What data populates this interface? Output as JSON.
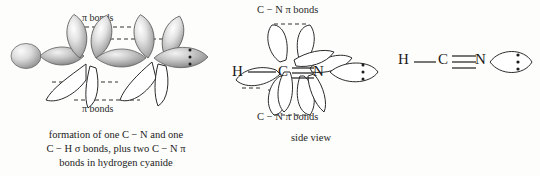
{
  "figure": {
    "background_color": "#fdfdfb",
    "ink_color": "#1c1c1c"
  },
  "panel_orbital": {
    "label_top": "π bonds",
    "label_bottom": "π bonds",
    "caption_lines": [
      "formation of one C − N and one",
      "C − H σ bonds, plus two C − N π",
      "bonds in hydrogen cyanide"
    ],
    "lone_pair_dots": 3
  },
  "panel_side": {
    "label_top": "C − N π bonds",
    "label_bottom": "C − N π bonds",
    "caption": "side view",
    "atoms": [
      {
        "symbol": "H"
      },
      {
        "symbol": "C"
      },
      {
        "symbol": "N"
      }
    ],
    "lone_pair_dots": 3
  },
  "panel_lewis": {
    "atoms": [
      {
        "symbol": "H"
      },
      {
        "symbol": "C"
      },
      {
        "symbol": "N"
      }
    ],
    "bond_ch": "single",
    "bond_cn": "triple",
    "lone_pair_dots": 3
  }
}
